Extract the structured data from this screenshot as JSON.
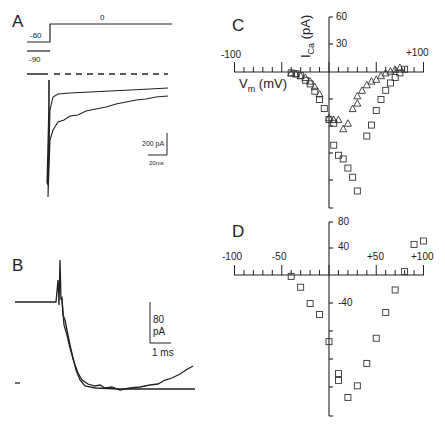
{
  "figure": {
    "panels": [
      "A",
      "B",
      "C",
      "D"
    ]
  },
  "panel_a": {
    "label": "A",
    "voltage_labels": {
      "hold1": "-60",
      "hold2": "-90",
      "step": "0"
    },
    "scale_bar": {
      "current": "200 pA",
      "time": "20ms"
    }
  },
  "panel_b": {
    "label": "B",
    "scale_bar": {
      "current_value": "80",
      "current_unit": "pA",
      "time": "1 ms"
    }
  },
  "panel_c": {
    "label": "C",
    "x_ticks": {
      "min": "-100",
      "max": "+100"
    },
    "y_ticks": [
      "60",
      "30"
    ],
    "xlabel": "Vm (mV)",
    "xlabel_main": "V",
    "xlabel_sub": "m",
    "xlabel_unit": "(mV)",
    "ylabel_main": "I",
    "ylabel_sub": "Ca",
    "ylabel_unit": "(pA)"
  },
  "panel_d": {
    "label": "D",
    "x_ticks": [
      "-100",
      "-50",
      "+50",
      "+100"
    ],
    "y_ticks": [
      "80",
      "40",
      "-40"
    ]
  },
  "chart_data": [
    {
      "panel": "C",
      "type": "scatter",
      "title": "",
      "xlabel": "Vm (mV)",
      "ylabel": "ICa (pA)",
      "xlim": [
        -100,
        100
      ],
      "ylim": [
        -150,
        60
      ],
      "grid": false,
      "series": [
        {
          "name": "triangles",
          "marker": "triangle",
          "points": [
            [
              -40,
              -1
            ],
            [
              -35,
              -2
            ],
            [
              -30,
              -4
            ],
            [
              -25,
              -6
            ],
            [
              -20,
              -10
            ],
            [
              -15,
              -16
            ],
            [
              -10,
              -24
            ],
            [
              0,
              -50
            ],
            [
              5,
              -52
            ],
            [
              10,
              -52
            ],
            [
              15,
              -62
            ],
            [
              20,
              -56
            ],
            [
              25,
              -40
            ],
            [
              30,
              -34
            ],
            [
              30,
              -26
            ],
            [
              35,
              -20
            ],
            [
              40,
              -14
            ],
            [
              45,
              -10
            ],
            [
              50,
              -8
            ],
            [
              55,
              -4
            ],
            [
              60,
              -1
            ],
            [
              65,
              1
            ],
            [
              70,
              3
            ],
            [
              75,
              5
            ]
          ]
        },
        {
          "name": "squares",
          "marker": "square",
          "points": [
            [
              -40,
              -1
            ],
            [
              -35,
              -2
            ],
            [
              -30,
              -4
            ],
            [
              -25,
              -9
            ],
            [
              -20,
              -13
            ],
            [
              -15,
              -21
            ],
            [
              -10,
              -30
            ],
            [
              -5,
              -40
            ],
            [
              0,
              -52
            ],
            [
              5,
              -56
            ],
            [
              5,
              -80
            ],
            [
              10,
              -91
            ],
            [
              15,
              -95
            ],
            [
              20,
              -105
            ],
            [
              25,
              -115
            ],
            [
              30,
              -130
            ],
            [
              40,
              -70
            ],
            [
              45,
              -58
            ],
            [
              50,
              -42
            ],
            [
              55,
              -30
            ],
            [
              60,
              -20
            ],
            [
              65,
              -12
            ],
            [
              70,
              -6
            ],
            [
              75,
              -1
            ],
            [
              80,
              3
            ]
          ]
        }
      ]
    },
    {
      "panel": "D",
      "type": "scatter",
      "title": "",
      "xlabel": "",
      "ylabel": "",
      "xlim": [
        -100,
        100
      ],
      "ylim": [
        -125,
        80
      ],
      "grid": false,
      "series": [
        {
          "name": "squares",
          "marker": "square",
          "points": [
            [
              -40,
              -2
            ],
            [
              -30,
              -18
            ],
            [
              -20,
              -42
            ],
            [
              -10,
              -58
            ],
            [
              0,
              -98
            ],
            [
              10,
              -145
            ],
            [
              10,
              -155
            ],
            [
              20,
              -180
            ],
            [
              30,
              -163
            ],
            [
              40,
              -130
            ],
            [
              50,
              -93
            ],
            [
              60,
              -55
            ],
            [
              70,
              -22
            ],
            [
              80,
              5
            ],
            [
              90,
              45
            ],
            [
              100,
              50
            ]
          ]
        }
      ]
    }
  ]
}
